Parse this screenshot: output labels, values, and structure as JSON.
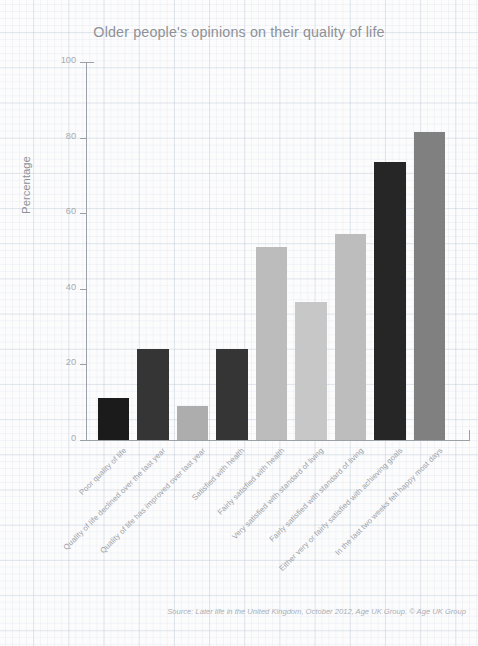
{
  "chart_data": {
    "type": "bar",
    "title": "Older people's opinions on their quality of life",
    "xlabel": "",
    "ylabel": "Percentage",
    "ylim": [
      0,
      100
    ],
    "yticks": [
      0,
      20,
      40,
      60,
      80,
      100
    ],
    "grid": true,
    "legend": "none",
    "source": "Source: Later life in the United Kingdom, October 2012, Age UK Group. © Age UK Group",
    "categories": [
      "Poor quality of life",
      "Quality of life declined over the last year",
      "Quality of life has improved over last year",
      "Satisfied with health",
      "Fairly satisfied with health",
      "Very satisfied with standard of living",
      "Fairly satisfied with standard of living",
      "Either very or fairly satisfied with achieving goals",
      "In the last two weeks felt happy most days"
    ],
    "values": [
      11,
      24,
      9,
      24,
      51,
      36.5,
      54.5,
      73.5,
      81.5
    ],
    "bar_colors": [
      "#1b1b1b",
      "#353535",
      "#adadad",
      "#353535",
      "#bcbcbc",
      "#c7c7c7",
      "#bdbdbd",
      "#262626",
      "#808080"
    ]
  },
  "axis": {
    "tick_labels": [
      "0",
      "20",
      "40",
      "60",
      "80",
      "100"
    ]
  }
}
